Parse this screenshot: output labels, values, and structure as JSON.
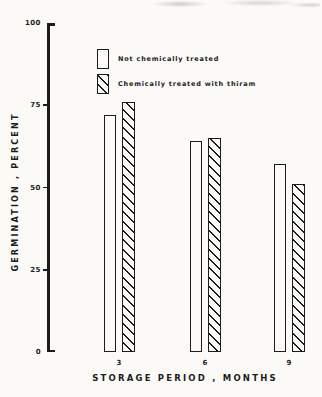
{
  "figure": {
    "paper_color": "#fbfaf6",
    "ink_color": "#1c1c1c"
  },
  "chart_data": {
    "type": "bar",
    "title": "",
    "categories": [
      "3",
      "6",
      "9"
    ],
    "series": [
      {
        "name": "Not chemically treated",
        "fill": "open",
        "values": [
          72,
          64,
          57
        ]
      },
      {
        "name": "Chemically treated with thiram",
        "fill": "hatched",
        "values": [
          76,
          65,
          51
        ]
      }
    ],
    "xlabel": "STORAGE PERIOD , MONTHS",
    "ylabel": "GERMINATION , PERCENT",
    "ylim": [
      0,
      100
    ],
    "yticks": [
      0,
      25,
      50,
      75,
      100
    ],
    "grid": false,
    "legend_position": "upper-left-inside"
  }
}
